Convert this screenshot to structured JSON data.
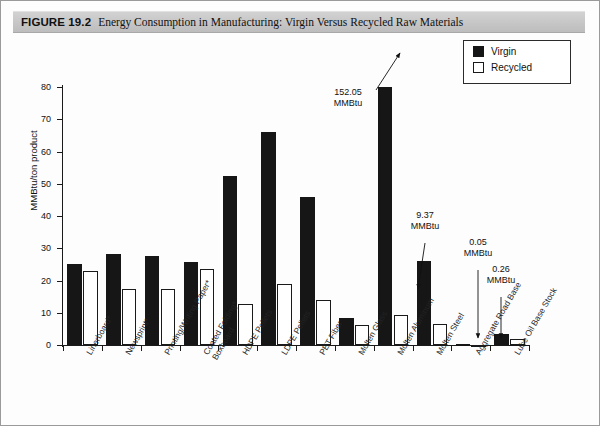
{
  "figure": {
    "label": "FIGURE 19.2",
    "title": "Energy Consumption in Manufacturing: Virgin Versus Recycled Raw Materials"
  },
  "legend": {
    "position": "top-right",
    "items": [
      {
        "name": "virgin",
        "label": "Virgin",
        "color": "#161616"
      },
      {
        "name": "recycled",
        "label": "Recycled",
        "color": "#ffffff"
      }
    ]
  },
  "axes": {
    "ylabel": "MMBtu/ton product",
    "yticks": [
      "0",
      "10",
      "20",
      "30",
      "40",
      "50",
      "60",
      "70",
      "80"
    ],
    "ymin": 0,
    "ymax": 80
  },
  "annotations": [
    {
      "name": "annotation-molten-aluminum-virgin",
      "value": "152.05",
      "unit": "MMBtu"
    },
    {
      "name": "annotation-molten-aluminum-recycled",
      "value": "9.37",
      "unit": "MMBtu"
    },
    {
      "name": "annotation-aggregate-road-base-recycled",
      "value": "0.05",
      "unit": "MMBtu"
    },
    {
      "name": "annotation-aggregate-road-base-virgin",
      "value": "0.26",
      "unit": "MMBtu"
    }
  ],
  "chart_data": {
    "type": "bar",
    "title": "Energy Consumption in Manufacturing: Virgin Versus Recycled Raw Materials",
    "xlabel": "",
    "ylabel": "MMBtu/ton product",
    "ylim": [
      0,
      80
    ],
    "grid": false,
    "legend_position": "top-right",
    "categories": [
      "Linerboard*",
      "Newsprint*",
      "Printing/Writing Paper*",
      "Coated Folding* Boxboard",
      "HDPE Pellets",
      "LDPE Pellets",
      "PET Fiber",
      "Molten Glass",
      "Molten Aluminum",
      "Molten Steel",
      "Aggregate Road Base",
      "Lube Oil Base Stock"
    ],
    "categories_lines": [
      [
        "Linerboard*"
      ],
      [
        "Newsprint*"
      ],
      [
        "Printing/Writing Paper*"
      ],
      [
        "Coated Folding*",
        "Boxboard"
      ],
      [
        "HDPE Pellets"
      ],
      [
        "LDPE Pellets"
      ],
      [
        "PET Fiber"
      ],
      [
        "Molten Glass"
      ],
      [
        "Molten Aluminum"
      ],
      [
        "Molten Steel"
      ],
      [
        "Aggregate Road Base"
      ],
      [
        "Lube Oil Base Stock"
      ]
    ],
    "series": [
      {
        "name": "Virgin",
        "color": "#161616",
        "values": [
          25.0,
          28.3,
          27.5,
          25.7,
          52.5,
          66.0,
          45.9,
          8.3,
          152.05,
          26.2,
          0.26,
          3.4
        ]
      },
      {
        "name": "Recycled",
        "color": "#ffffff",
        "values": [
          23.1,
          17.3,
          17.3,
          23.7,
          12.8,
          19.0,
          14.0,
          6.3,
          9.37,
          6.5,
          0.05,
          2.0
        ]
      }
    ],
    "notes": [
      "Molten Aluminum virgin bar is clipped at the top of the 0-80 axis; its true value is 152.05 MMBtu.",
      "Asterisk (*) marks paper-grade products."
    ]
  }
}
